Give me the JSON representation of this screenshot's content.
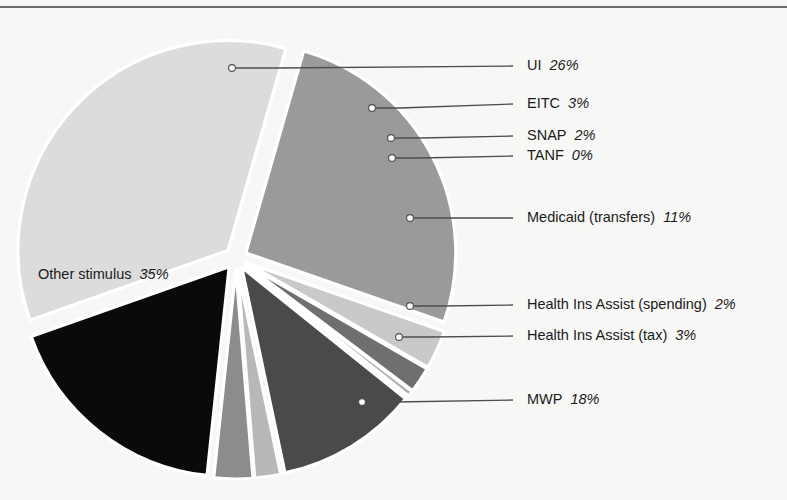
{
  "chart_data": {
    "type": "pie",
    "title": "",
    "subtitle": "",
    "xlabel": "",
    "ylabel": "",
    "legend_position": "callout-labels-right",
    "grid": false,
    "units": "percent",
    "categories": [
      "UI",
      "EITC",
      "SNAP",
      "TANF",
      "Medicaid (transfers)",
      "Health Ins Assist (spending)",
      "Health Ins Assist (tax)",
      "MWP",
      "Other stimulus"
    ],
    "values": [
      26,
      3,
      2,
      0,
      11,
      2,
      3,
      18,
      35
    ],
    "value_labels": [
      "26%",
      "3%",
      "2%",
      "0%",
      "11%",
      "2%",
      "3%",
      "18%",
      "35%"
    ],
    "colors": [
      "#9a9a9a",
      "#c9c9c9",
      "#6f6f6f",
      "#b0b0b0",
      "#4a4a4a",
      "#b8b8b8",
      "#8c8c8c",
      "#0a0a0a",
      "#dcdcdc"
    ],
    "slices": [
      {
        "name": "UI",
        "value": 26,
        "value_label": "26%",
        "color": "#9a9a9a",
        "label_placement": "callout-right",
        "label_x": 527,
        "label_y": 66,
        "dot_x": 232,
        "dot_y": 68,
        "elbow_x": 275,
        "elbow_y": 68
      },
      {
        "name": "EITC",
        "value": 3,
        "value_label": "3%",
        "color": "#c9c9c9",
        "label_placement": "callout-right",
        "label_x": 527,
        "label_y": 104,
        "dot_x": 372,
        "dot_y": 108,
        "elbow_x": 400,
        "elbow_y": 108
      },
      {
        "name": "SNAP",
        "value": 2,
        "value_label": "2%",
        "color": "#6f6f6f",
        "label_placement": "callout-right",
        "label_x": 527,
        "label_y": 136,
        "dot_x": 391,
        "dot_y": 138,
        "elbow_x": 420,
        "elbow_y": 138
      },
      {
        "name": "TANF",
        "value": 0,
        "value_label": "0%",
        "color": "#b0b0b0",
        "label_placement": "callout-right",
        "label_x": 527,
        "label_y": 156,
        "dot_x": 392,
        "dot_y": 158,
        "elbow_x": 420,
        "elbow_y": 158
      },
      {
        "name": "Medicaid (transfers)",
        "value": 11,
        "value_label": "11%",
        "color": "#4a4a4a",
        "label_placement": "callout-right",
        "label_x": 527,
        "label_y": 218,
        "dot_x": 410,
        "dot_y": 218,
        "elbow_x": 440,
        "elbow_y": 218
      },
      {
        "name": "Health Ins Assist (spending)",
        "value": 2,
        "value_label": "2%",
        "color": "#b8b8b8",
        "label_placement": "callout-right",
        "label_x": 527,
        "label_y": 305,
        "dot_x": 410,
        "dot_y": 306,
        "elbow_x": 440,
        "elbow_y": 306
      },
      {
        "name": "Health Ins Assist (tax)",
        "value": 3,
        "value_label": "3%",
        "color": "#8c8c8c",
        "label_placement": "callout-right",
        "label_x": 527,
        "label_y": 336,
        "dot_x": 399,
        "dot_y": 337,
        "elbow_x": 430,
        "elbow_y": 337
      },
      {
        "name": "MWP",
        "value": 18,
        "value_label": "18%",
        "color": "#0a0a0a",
        "label_placement": "callout-right",
        "label_x": 527,
        "label_y": 400,
        "dot_x": 362,
        "dot_y": 402,
        "elbow_x": 395,
        "elbow_y": 402
      },
      {
        "name": "Other stimulus",
        "value": 35,
        "value_label": "35%",
        "color": "#dcdcdc",
        "label_placement": "inside",
        "label_x": 38,
        "label_y": 275,
        "dot_x": null,
        "dot_y": null,
        "elbow_x": null,
        "elbow_y": null
      }
    ]
  },
  "figure": {
    "background_color": "#f7f7f5",
    "rule_color": "#6a6a6a",
    "text_color": "#1a1a1a",
    "leader_color": "#4d4d4d",
    "slice_edge_color": "#ffffff",
    "dot_fill_color": "#ffffff",
    "center_x": 236,
    "center_y": 258,
    "radius": 210
  }
}
